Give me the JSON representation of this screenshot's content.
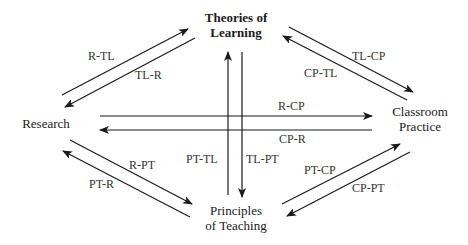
{
  "diagram": {
    "type": "relationship-diagram",
    "colors": {
      "line": "#1a1a1a",
      "text": "#1a1a1a",
      "label": "#333333",
      "background": "#ffffff"
    },
    "nodes": {
      "theories": {
        "line1": "Theories of",
        "line2": "Learning"
      },
      "research": {
        "label": "Research"
      },
      "classroom": {
        "line1": "Classroom",
        "line2": "Practice"
      },
      "principles": {
        "line1": "Principles",
        "line2": "of Teaching"
      }
    },
    "edges": {
      "r_tl": "R-TL",
      "tl_r": "TL-R",
      "tl_cp": "TL-CP",
      "cp_tl": "CP-TL",
      "r_cp": "R-CP",
      "cp_r": "CP-R",
      "pt_tl": "PT-TL",
      "tl_pt": "TL-PT",
      "r_pt": "R-PT",
      "pt_r": "PT-R",
      "pt_cp": "PT-CP",
      "cp_pt": "CP-PT"
    }
  }
}
